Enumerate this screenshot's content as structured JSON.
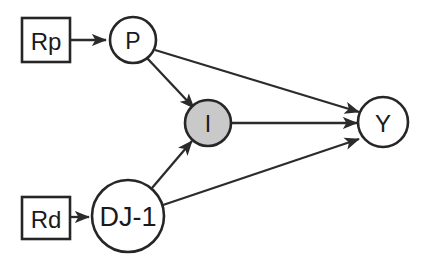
{
  "diagram": {
    "background_color": "#ffffff",
    "stroke_color": "#262626",
    "highlight_fill_color": "#c9c9c9",
    "plain_fill_color": "#ffffff",
    "nodes": [
      {
        "id": "Rp",
        "label": "Rp",
        "shape": "rectangle",
        "x": 22,
        "y": 18,
        "width": 48,
        "height": 44,
        "font_size": 24,
        "filled": false
      },
      {
        "id": "P",
        "label": "P",
        "shape": "circle",
        "cx": 133,
        "cy": 40,
        "r": 23,
        "font_size": 23,
        "filled": false
      },
      {
        "id": "I",
        "label": "I",
        "shape": "circle",
        "cx": 208,
        "cy": 123,
        "r": 23,
        "font_size": 23,
        "filled": true
      },
      {
        "id": "Rd",
        "label": "Rd",
        "shape": "rectangle",
        "x": 22,
        "y": 197,
        "width": 48,
        "height": 42,
        "font_size": 24,
        "filled": false
      },
      {
        "id": "DJ1",
        "label": "DJ-1",
        "shape": "circle",
        "cx": 128,
        "cy": 216,
        "r": 36,
        "font_size": 27,
        "filled": false
      },
      {
        "id": "Y",
        "label": "Y",
        "shape": "circle",
        "cx": 383,
        "cy": 122,
        "r": 25,
        "font_size": 24,
        "filled": false
      }
    ],
    "edges": [
      {
        "id": "Rp-P",
        "from": "Rp",
        "to": "P",
        "x1": 71,
        "y1": 40,
        "x2": 106,
        "y2": 40,
        "arrowhead": true
      },
      {
        "id": "Rd-DJ1",
        "from": "Rd",
        "to": "DJ1",
        "x1": 71,
        "y1": 217,
        "x2": 89,
        "y2": 217,
        "arrowhead": true
      },
      {
        "id": "P-I",
        "from": "P",
        "to": "I",
        "x1": 147,
        "y1": 58,
        "x2": 194,
        "y2": 108,
        "arrowhead": true
      },
      {
        "id": "P-Y",
        "from": "P",
        "to": "Y",
        "x1": 155,
        "y1": 50,
        "x2": 359,
        "y2": 112,
        "arrowhead": true
      },
      {
        "id": "I-Y",
        "from": "I",
        "to": "Y",
        "x1": 232,
        "y1": 123,
        "x2": 357,
        "y2": 123,
        "arrowhead": true
      },
      {
        "id": "DJ1-I",
        "from": "DJ1",
        "to": "I",
        "x1": 152,
        "y1": 188,
        "x2": 192,
        "y2": 141,
        "arrowhead": true
      },
      {
        "id": "DJ1-Y",
        "from": "DJ1",
        "to": "Y",
        "x1": 163,
        "y1": 205,
        "x2": 359,
        "y2": 139,
        "arrowhead": true
      }
    ]
  }
}
